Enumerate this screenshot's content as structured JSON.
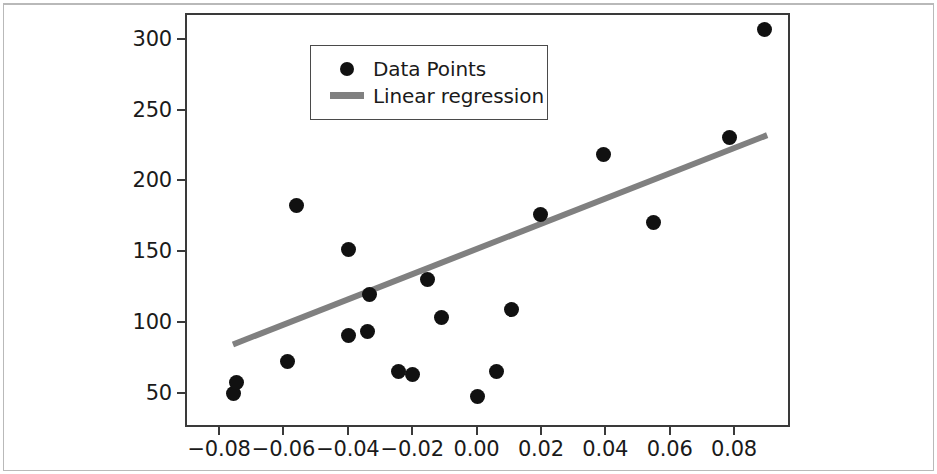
{
  "figure": {
    "background_color": "#ffffff",
    "frame_color": "#3a3a3a",
    "outer_border_color": "#b9b9b9"
  },
  "legend": {
    "position": "upper left",
    "border_color": "#4a4a4a",
    "entries": [
      {
        "label": "Data Points",
        "marker": "circle",
        "color": "#111111"
      },
      {
        "label": "Linear regression",
        "marker": "line",
        "color": "#808080"
      }
    ]
  },
  "chart_data": {
    "type": "scatter",
    "title": "",
    "subtitle": "",
    "xlabel": "",
    "ylabel": "",
    "grid": false,
    "legend_position": "upper left",
    "xlim": [
      -0.0906,
      0.0974
    ],
    "ylim": [
      25.6,
      318.4
    ],
    "xticks": [
      -0.08,
      -0.06,
      -0.04,
      -0.02,
      0.0,
      0.02,
      0.04,
      0.06,
      0.08
    ],
    "xtick_labels": [
      "−0.08",
      "−0.06",
      "−0.04",
      "−0.02",
      "0.00",
      "0.02",
      "0.04",
      "0.06",
      "0.08"
    ],
    "yticks": [
      50,
      100,
      150,
      200,
      250,
      300
    ],
    "ytick_labels": [
      "50",
      "100",
      "150",
      "200",
      "250",
      "300"
    ],
    "series": [
      {
        "name": "Data Points",
        "type": "scatter",
        "color": "#111111",
        "marker": "o",
        "marker_size": 15,
        "points": [
          {
            "x": -0.0755,
            "y": 49
          },
          {
            "x": -0.0745,
            "y": 57
          },
          {
            "x": -0.0588,
            "y": 72
          },
          {
            "x": -0.056,
            "y": 182
          },
          {
            "x": -0.0399,
            "y": 151
          },
          {
            "x": -0.0399,
            "y": 90
          },
          {
            "x": -0.0338,
            "y": 93
          },
          {
            "x": -0.0332,
            "y": 119
          },
          {
            "x": -0.0242,
            "y": 65
          },
          {
            "x": -0.02,
            "y": 63
          },
          {
            "x": -0.0152,
            "y": 130
          },
          {
            "x": -0.011,
            "y": 103
          },
          {
            "x": 0.0004,
            "y": 47
          },
          {
            "x": 0.0062,
            "y": 65
          },
          {
            "x": 0.011,
            "y": 109
          },
          {
            "x": 0.02,
            "y": 176
          },
          {
            "x": 0.0393,
            "y": 218
          },
          {
            "x": 0.0549,
            "y": 170
          },
          {
            "x": 0.0786,
            "y": 230
          },
          {
            "x": 0.0895,
            "y": 307
          }
        ]
      },
      {
        "name": "Linear regression",
        "type": "line",
        "color": "#808080",
        "line_width": 6,
        "x": [
          -0.0757,
          0.0903
        ],
        "y": [
          84,
          232
        ]
      }
    ]
  }
}
